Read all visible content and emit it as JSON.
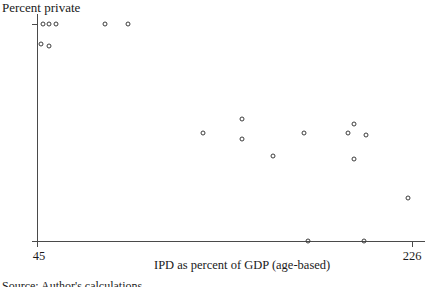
{
  "chart_data": {
    "type": "scatter",
    "title": "",
    "xlabel": "IPD as percent of GDP (age-based)",
    "ylabel": "Percent private",
    "xlim": [
      45,
      226
    ],
    "ylim": [
      0,
      100
    ],
    "xticks": [
      45,
      226
    ],
    "xticklabels": [
      "45",
      "226"
    ],
    "yticks": [
      0,
      100
    ],
    "yticklabels": [
      "0",
      "100"
    ],
    "grid": false,
    "legend": null,
    "marker": "open-circle",
    "points": [
      {
        "x": 48,
        "y": 100
      },
      {
        "x": 51,
        "y": 100
      },
      {
        "x": 54,
        "y": 100
      },
      {
        "x": 47,
        "y": 91
      },
      {
        "x": 51,
        "y": 90
      },
      {
        "x": 78,
        "y": 100
      },
      {
        "x": 89,
        "y": 100
      },
      {
        "x": 125,
        "y": 50
      },
      {
        "x": 144,
        "y": 56
      },
      {
        "x": 144,
        "y": 47
      },
      {
        "x": 159,
        "y": 39
      },
      {
        "x": 174,
        "y": 50
      },
      {
        "x": 176,
        "y": 0
      },
      {
        "x": 198,
        "y": 38
      },
      {
        "x": 198,
        "y": 54
      },
      {
        "x": 195,
        "y": 50
      },
      {
        "x": 204,
        "y": 49
      },
      {
        "x": 203,
        "y": 0
      },
      {
        "x": 224,
        "y": 20
      }
    ]
  },
  "footer": {
    "clipped_text": "Source: Author's calculations."
  }
}
